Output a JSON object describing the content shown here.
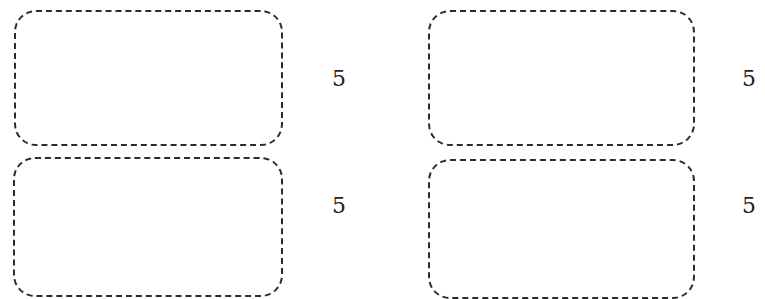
{
  "items": [
    {
      "id": "top-left",
      "label": "5"
    },
    {
      "id": "bottom-left",
      "label": "5"
    },
    {
      "id": "top-right",
      "label": "5"
    },
    {
      "id": "bottom-right",
      "label": "5"
    }
  ],
  "colors": {
    "border": "#2b2b2b",
    "text": "#1f1f1f",
    "background": "#ffffff"
  }
}
